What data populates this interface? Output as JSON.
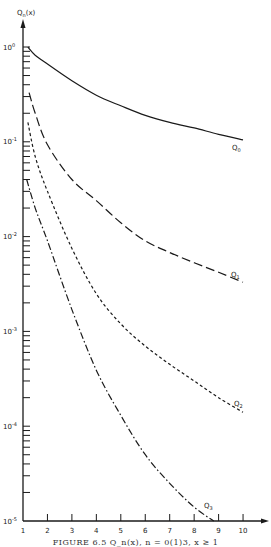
{
  "chart_data": {
    "type": "line",
    "title": "",
    "xlabel": "x",
    "ylabel": "Q_n(x)",
    "y_scale": "log",
    "xlim": [
      1,
      10
    ],
    "ylim": [
      1e-05,
      1
    ],
    "x_ticks": [
      "1",
      "2",
      "3",
      "4",
      "5",
      "6",
      "7",
      "8",
      "9",
      "10"
    ],
    "y_ticks": [
      {
        "base": "10",
        "exp": "0"
      },
      {
        "base": "10",
        "exp": "-1"
      },
      {
        "base": "10",
        "exp": "-2"
      },
      {
        "base": "10",
        "exp": "-3"
      },
      {
        "base": "10",
        "exp": "-4"
      },
      {
        "base": "10",
        "exp": "-5"
      }
    ],
    "grid": false,
    "legend": "inline labels at curve ends",
    "series": [
      {
        "name": "Q0",
        "style": "solid",
        "x": [
          1.2,
          1.5,
          2,
          3,
          4,
          5,
          6,
          7,
          8,
          9,
          10
        ],
        "values": [
          1.0,
          0.82,
          0.66,
          0.44,
          0.31,
          0.24,
          0.19,
          0.16,
          0.14,
          0.12,
          0.105
        ]
      },
      {
        "name": "Q1",
        "style": "long-dash",
        "x": [
          1.25,
          1.5,
          2,
          3,
          4,
          5,
          6,
          7,
          8,
          9,
          10
        ],
        "values": [
          0.33,
          0.2,
          0.093,
          0.04,
          0.024,
          0.014,
          0.009,
          0.0068,
          0.0053,
          0.0042,
          0.0033
        ]
      },
      {
        "name": "Q2",
        "style": "short-dash",
        "x": [
          1.2,
          1.5,
          2,
          3,
          4,
          5,
          6,
          7,
          8,
          9,
          10
        ],
        "values": [
          0.16,
          0.07,
          0.03,
          0.0075,
          0.0025,
          0.0012,
          0.0007,
          0.00045,
          0.0003,
          0.0002,
          0.00014
        ]
      },
      {
        "name": "Q3",
        "style": "dash-dot",
        "x": [
          1.15,
          1.5,
          2,
          3,
          4,
          5,
          6,
          7,
          8,
          8.8
        ],
        "values": [
          0.04,
          0.02,
          0.009,
          0.0017,
          0.00039,
          0.00013,
          5e-05,
          2.5e-05,
          1.4e-05,
          1e-05
        ]
      }
    ],
    "annotations": [
      "Q0",
      "Q1",
      "Q2",
      "Q3"
    ],
    "caption": "FIGURE 6.5   Q_n(x), n = 0(1)3, x ≥ 1"
  },
  "labels": {
    "y_axis": "Qn(x)",
    "y_axis_base": "Q",
    "y_axis_sub": "n",
    "y_axis_arg": "(x)",
    "q0": "Q0",
    "q1": "Q1",
    "q2": "Q2",
    "q3": "Q3",
    "caption": "FIGURE 6.5   Q_n(x), n = 0(1)3, x ≥ 1"
  }
}
